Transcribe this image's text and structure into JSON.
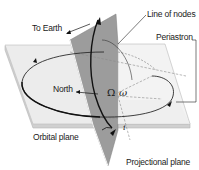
{
  "diagram": {
    "labels": {
      "to_earth": "To Earth",
      "line_of_nodes": "Line of nodes",
      "periastron": "Periastron",
      "north": "North",
      "omega_upper": "Ω",
      "omega_lower": "ω",
      "inclination": "i",
      "orbital_plane": "Orbital plane",
      "projectional_plane": "Projectional plane"
    },
    "colors": {
      "orbital_plane_fill": "#ececec",
      "orbital_plane_edge": "#c8c8c8",
      "projectional_plane_fill": "#9a9a9a",
      "sky_panel_fill": "#f4f4f4",
      "orbit_line": "#1a1a1a",
      "dashed_line": "#8a8a8a"
    }
  }
}
